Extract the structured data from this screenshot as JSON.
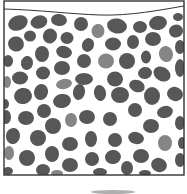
{
  "diagram": {
    "type": "particle-packing-container",
    "colors": {
      "background": "#ffffff",
      "border": "#333333",
      "particle_dark": "#575757",
      "particle_light": "#858585",
      "smudge": "#b0b0b0"
    },
    "container": {
      "x": 4,
      "y": 1,
      "width": 180,
      "height": 174
    },
    "top_surface": {
      "path": "M4,9 C40,10 70,14 100,15 C130,16 160,10 184,6"
    },
    "particles": [
      {
        "cx": 18,
        "cy": 23,
        "rx": 10,
        "ry": 7.5,
        "rot": -20,
        "tone": "dark"
      },
      {
        "cx": 39,
        "cy": 22,
        "rx": 8.5,
        "ry": 6.5,
        "rot": -15,
        "tone": "dark"
      },
      {
        "cx": 59,
        "cy": 20,
        "rx": 8,
        "ry": 6,
        "rot": 5,
        "tone": "dark"
      },
      {
        "cx": 81,
        "cy": 24,
        "rx": 7,
        "ry": 7,
        "rot": 0,
        "tone": "dark"
      },
      {
        "cx": 98,
        "cy": 31,
        "rx": 6.5,
        "ry": 7,
        "rot": 10,
        "tone": "light"
      },
      {
        "cx": 117,
        "cy": 26,
        "rx": 10,
        "ry": 7.5,
        "rot": 10,
        "tone": "dark"
      },
      {
        "cx": 140,
        "cy": 27,
        "rx": 7,
        "ry": 6,
        "rot": 0,
        "tone": "dark"
      },
      {
        "cx": 158,
        "cy": 23,
        "rx": 9,
        "ry": 7,
        "rot": -10,
        "tone": "dark"
      },
      {
        "cx": 178,
        "cy": 17,
        "rx": 5,
        "ry": 4,
        "rot": 0,
        "tone": "dark"
      },
      {
        "cx": 176,
        "cy": 31,
        "rx": 7,
        "ry": 6.5,
        "rot": -20,
        "tone": "dark"
      },
      {
        "cx": 30,
        "cy": 36,
        "rx": 6,
        "ry": 5.5,
        "rot": 0,
        "tone": "dark"
      },
      {
        "cx": 50,
        "cy": 36,
        "rx": 7,
        "ry": 7.5,
        "rot": 25,
        "tone": "dark"
      },
      {
        "cx": 67,
        "cy": 38,
        "rx": 6.5,
        "ry": 6,
        "rot": 0,
        "tone": "dark"
      },
      {
        "cx": 16,
        "cy": 44,
        "rx": 8,
        "ry": 7.5,
        "rot": 10,
        "tone": "dark"
      },
      {
        "cx": 88,
        "cy": 45,
        "rx": 6,
        "ry": 7,
        "rot": 20,
        "tone": "dark"
      },
      {
        "cx": 113,
        "cy": 44,
        "rx": 8,
        "ry": 6.5,
        "rot": 0,
        "tone": "dark"
      },
      {
        "cx": 133,
        "cy": 42,
        "rx": 6,
        "ry": 7,
        "rot": 0,
        "tone": "dark"
      },
      {
        "cx": 153,
        "cy": 39,
        "rx": 8,
        "ry": 7,
        "rot": 0,
        "tone": "dark"
      },
      {
        "cx": 180,
        "cy": 47,
        "rx": 5,
        "ry": 7,
        "rot": 0,
        "tone": "dark"
      },
      {
        "cx": 42,
        "cy": 54,
        "rx": 7,
        "ry": 8,
        "rot": 0,
        "tone": "dark"
      },
      {
        "cx": 64,
        "cy": 52,
        "rx": 8,
        "ry": 6,
        "rot": 15,
        "tone": "dark"
      },
      {
        "cx": 146,
        "cy": 57,
        "rx": 5,
        "ry": 6.5,
        "rot": 0,
        "tone": "dark"
      },
      {
        "cx": 166,
        "cy": 54,
        "rx": 7,
        "ry": 8,
        "rot": -15,
        "tone": "light"
      },
      {
        "cx": 8,
        "cy": 61,
        "rx": 5,
        "ry": 6,
        "rot": 0,
        "tone": "dark"
      },
      {
        "cx": 27,
        "cy": 63,
        "rx": 6,
        "ry": 7,
        "rot": 10,
        "tone": "dark"
      },
      {
        "cx": 84,
        "cy": 61,
        "rx": 7,
        "ry": 7,
        "rot": 0,
        "tone": "dark"
      },
      {
        "cx": 106,
        "cy": 61,
        "rx": 8,
        "ry": 7.5,
        "rot": 0,
        "tone": "light"
      },
      {
        "cx": 127,
        "cy": 61,
        "rx": 8,
        "ry": 8,
        "rot": 0,
        "tone": "dark"
      },
      {
        "cx": 62,
        "cy": 68,
        "rx": 8,
        "ry": 7,
        "rot": 0,
        "tone": "dark"
      },
      {
        "cx": 43,
        "cy": 73,
        "rx": 7,
        "ry": 6.5,
        "rot": 0,
        "tone": "dark"
      },
      {
        "cx": 145,
        "cy": 73,
        "rx": 7,
        "ry": 6,
        "rot": -10,
        "tone": "dark"
      },
      {
        "cx": 162,
        "cy": 74,
        "rx": 9,
        "ry": 7,
        "rot": 30,
        "tone": "dark"
      },
      {
        "cx": 20,
        "cy": 78,
        "rx": 8,
        "ry": 6.5,
        "rot": 0,
        "tone": "dark"
      },
      {
        "cx": 84,
        "cy": 79,
        "rx": 9,
        "ry": 6,
        "rot": 0,
        "tone": "dark"
      },
      {
        "cx": 115,
        "cy": 79,
        "rx": 8,
        "ry": 7.5,
        "rot": 0,
        "tone": "dark"
      },
      {
        "cx": 180,
        "cy": 68,
        "rx": 5,
        "ry": 9,
        "rot": 0,
        "tone": "dark"
      },
      {
        "cx": 64,
        "cy": 84,
        "rx": 8,
        "ry": 5,
        "rot": -10,
        "tone": "light"
      },
      {
        "cx": 137,
        "cy": 86,
        "rx": 8,
        "ry": 6,
        "rot": 20,
        "tone": "dark"
      },
      {
        "cx": 7,
        "cy": 82,
        "rx": 4,
        "ry": 6,
        "rot": 0,
        "tone": "light"
      },
      {
        "cx": 23,
        "cy": 96,
        "rx": 9,
        "ry": 8,
        "rot": -10,
        "tone": "dark"
      },
      {
        "cx": 41,
        "cy": 92,
        "rx": 7,
        "ry": 8,
        "rot": 15,
        "tone": "dark"
      },
      {
        "cx": 79,
        "cy": 92,
        "rx": 6,
        "ry": 8,
        "rot": 10,
        "tone": "dark"
      },
      {
        "cx": 100,
        "cy": 93,
        "rx": 6,
        "ry": 8,
        "rot": -10,
        "tone": "dark"
      },
      {
        "cx": 120,
        "cy": 95,
        "rx": 9,
        "ry": 8,
        "rot": 0,
        "tone": "dark"
      },
      {
        "cx": 152,
        "cy": 96,
        "rx": 8,
        "ry": 9,
        "rot": 0,
        "tone": "dark"
      },
      {
        "cx": 175,
        "cy": 94,
        "rx": 8,
        "ry": 7,
        "rot": 20,
        "tone": "dark"
      },
      {
        "cx": 5,
        "cy": 104,
        "rx": 4,
        "ry": 5,
        "rot": 0,
        "tone": "dark"
      },
      {
        "cx": 62,
        "cy": 101,
        "rx": 9,
        "ry": 7,
        "rot": -10,
        "tone": "dark"
      },
      {
        "cx": 44,
        "cy": 111,
        "rx": 7,
        "ry": 7,
        "rot": 0,
        "tone": "dark"
      },
      {
        "cx": 135,
        "cy": 110,
        "rx": 7,
        "ry": 7,
        "rot": 0,
        "tone": "dark"
      },
      {
        "cx": 165,
        "cy": 112,
        "rx": 8,
        "ry": 6,
        "rot": -15,
        "tone": "dark"
      },
      {
        "cx": 6,
        "cy": 117,
        "rx": 5,
        "ry": 7,
        "rot": 0,
        "tone": "dark"
      },
      {
        "cx": 26,
        "cy": 118,
        "rx": 8,
        "ry": 7,
        "rot": 0,
        "tone": "dark"
      },
      {
        "cx": 71,
        "cy": 120,
        "rx": 6,
        "ry": 7,
        "rot": 0,
        "tone": "light"
      },
      {
        "cx": 87,
        "cy": 117,
        "rx": 8,
        "ry": 7,
        "rot": 0,
        "tone": "dark"
      },
      {
        "cx": 110,
        "cy": 119,
        "rx": 7,
        "ry": 7,
        "rot": 0,
        "tone": "dark"
      },
      {
        "cx": 180,
        "cy": 123,
        "rx": 5,
        "ry": 7,
        "rot": 0,
        "tone": "dark"
      },
      {
        "cx": 53,
        "cy": 126,
        "rx": 8,
        "ry": 8,
        "rot": 0,
        "tone": "dark"
      },
      {
        "cx": 151,
        "cy": 126,
        "rx": 8,
        "ry": 7,
        "rot": 0,
        "tone": "dark"
      },
      {
        "cx": 13,
        "cy": 136,
        "rx": 7,
        "ry": 8,
        "rot": 10,
        "tone": "dark"
      },
      {
        "cx": 38,
        "cy": 138,
        "rx": 8,
        "ry": 8,
        "rot": 0,
        "tone": "dark"
      },
      {
        "cx": 91,
        "cy": 139,
        "rx": 6,
        "ry": 8,
        "rot": 0,
        "tone": "dark"
      },
      {
        "cx": 115,
        "cy": 140,
        "rx": 7,
        "ry": 7,
        "rot": 0,
        "tone": "dark"
      },
      {
        "cx": 136,
        "cy": 138,
        "rx": 8,
        "ry": 6,
        "rot": 15,
        "tone": "dark"
      },
      {
        "cx": 165,
        "cy": 143,
        "rx": 7,
        "ry": 8,
        "rot": 0,
        "tone": "light"
      },
      {
        "cx": 70,
        "cy": 144,
        "rx": 8,
        "ry": 7,
        "rot": 0,
        "tone": "dark"
      },
      {
        "cx": 182,
        "cy": 143,
        "rx": 4,
        "ry": 6,
        "rot": 0,
        "tone": "dark"
      },
      {
        "cx": 9,
        "cy": 153,
        "rx": 5,
        "ry": 7,
        "rot": 0,
        "tone": "light"
      },
      {
        "cx": 27,
        "cy": 158,
        "rx": 8,
        "ry": 8,
        "rot": 0,
        "tone": "dark"
      },
      {
        "cx": 52,
        "cy": 154,
        "rx": 7,
        "ry": 8,
        "rot": 0,
        "tone": "dark"
      },
      {
        "cx": 92,
        "cy": 159,
        "rx": 7,
        "ry": 7,
        "rot": 0,
        "tone": "dark"
      },
      {
        "cx": 113,
        "cy": 157,
        "rx": 8,
        "ry": 7,
        "rot": -10,
        "tone": "dark"
      },
      {
        "cx": 141,
        "cy": 156,
        "rx": 8,
        "ry": 7,
        "rot": 0,
        "tone": "dark"
      },
      {
        "cx": 180,
        "cy": 160,
        "rx": 5,
        "ry": 7,
        "rot": 0,
        "tone": "dark"
      },
      {
        "cx": 70,
        "cy": 165,
        "rx": 8,
        "ry": 7,
        "rot": 0,
        "tone": "dark"
      },
      {
        "cx": 127,
        "cy": 168,
        "rx": 6,
        "ry": 7,
        "rot": 0,
        "tone": "dark"
      },
      {
        "cx": 159,
        "cy": 165,
        "rx": 8,
        "ry": 7,
        "rot": 20,
        "tone": "dark"
      },
      {
        "cx": 43,
        "cy": 170,
        "rx": 7,
        "ry": 6,
        "rot": 0,
        "tone": "dark"
      },
      {
        "cx": 8,
        "cy": 171,
        "rx": 5,
        "ry": 4,
        "rot": 0,
        "tone": "dark"
      },
      {
        "cx": 100,
        "cy": 172,
        "rx": 7,
        "ry": 4,
        "rot": 0,
        "tone": "dark"
      },
      {
        "cx": 57,
        "cy": 173,
        "rx": 6,
        "ry": 3,
        "rot": 0,
        "tone": "light"
      },
      {
        "cx": 145,
        "cy": 173,
        "rx": 6,
        "ry": 3,
        "rot": 0,
        "tone": "dark"
      }
    ],
    "bottom_smudge": {
      "cx": 113,
      "cy": 192,
      "rx": 22,
      "ry": 2
    }
  }
}
